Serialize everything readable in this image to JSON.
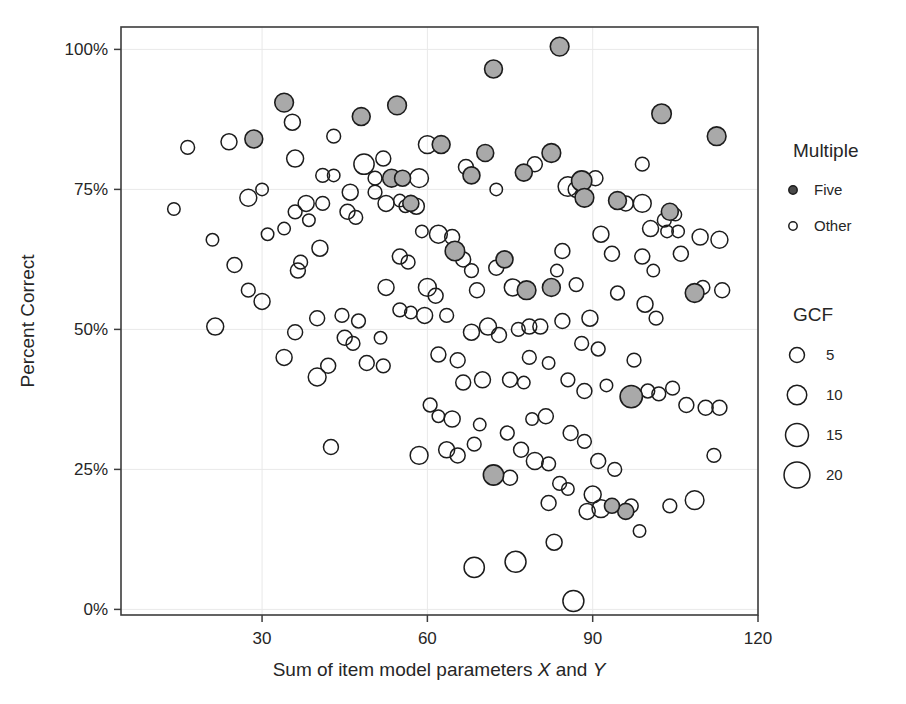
{
  "chart_data": {
    "type": "scatter",
    "title": "",
    "xlabel": "Sum of item model parameters X and Y",
    "xlabel_parts": {
      "lead": "Sum of item model parameters ",
      "em1": "X",
      "mid": " and ",
      "em2": "Y"
    },
    "ylabel": "Percent Correct",
    "xlim": [
      4.4,
      120
    ],
    "ylim": [
      -1,
      104
    ],
    "xticks": [
      30,
      60,
      90,
      120
    ],
    "xticklabels": [
      "30",
      "60",
      "90",
      "120"
    ],
    "yticks": [
      0,
      25,
      50,
      75,
      100
    ],
    "yticklabels": [
      "0%",
      "25%",
      "50%",
      "75%",
      "100%"
    ],
    "grid": true,
    "legend_position": "right",
    "size_encoding": "GCF",
    "color_encoding": "Multiple",
    "series": [
      {
        "name": "Five",
        "marker": "filled-circle",
        "color": "#a9a9a9",
        "points": [
          {
            "x": 84.0,
            "y": 100.5,
            "gcf": 9
          },
          {
            "x": 72.0,
            "y": 96.5,
            "gcf": 8
          },
          {
            "x": 34.0,
            "y": 90.5,
            "gcf": 9
          },
          {
            "x": 54.5,
            "y": 90.0,
            "gcf": 9
          },
          {
            "x": 102.5,
            "y": 88.5,
            "gcf": 10
          },
          {
            "x": 48.0,
            "y": 88.0,
            "gcf": 8
          },
          {
            "x": 112.5,
            "y": 84.5,
            "gcf": 9
          },
          {
            "x": 28.5,
            "y": 84.0,
            "gcf": 8
          },
          {
            "x": 62.5,
            "y": 83.0,
            "gcf": 8
          },
          {
            "x": 70.5,
            "y": 81.5,
            "gcf": 7
          },
          {
            "x": 82.5,
            "y": 81.5,
            "gcf": 9
          },
          {
            "x": 68.0,
            "y": 77.5,
            "gcf": 7
          },
          {
            "x": 77.5,
            "y": 78.0,
            "gcf": 7
          },
          {
            "x": 88.0,
            "y": 76.5,
            "gcf": 11
          },
          {
            "x": 53.5,
            "y": 77.0,
            "gcf": 8
          },
          {
            "x": 55.5,
            "y": 77.0,
            "gcf": 6
          },
          {
            "x": 88.5,
            "y": 73.5,
            "gcf": 9
          },
          {
            "x": 94.5,
            "y": 73.0,
            "gcf": 8
          },
          {
            "x": 57.0,
            "y": 72.5,
            "gcf": 6
          },
          {
            "x": 104.0,
            "y": 71.0,
            "gcf": 7
          },
          {
            "x": 65.0,
            "y": 64.0,
            "gcf": 10
          },
          {
            "x": 74.0,
            "y": 62.5,
            "gcf": 7
          },
          {
            "x": 78.0,
            "y": 57.0,
            "gcf": 9
          },
          {
            "x": 82.5,
            "y": 57.5,
            "gcf": 8
          },
          {
            "x": 108.5,
            "y": 56.5,
            "gcf": 9
          },
          {
            "x": 97.0,
            "y": 38.0,
            "gcf": 14
          },
          {
            "x": 72.0,
            "y": 24.0,
            "gcf": 11
          },
          {
            "x": 96.0,
            "y": 17.5,
            "gcf": 6
          },
          {
            "x": 93.5,
            "y": 18.5,
            "gcf": 5
          }
        ]
      },
      {
        "name": "Other",
        "marker": "open-circle",
        "color": "#ffffff",
        "points": [
          {
            "x": 35.5,
            "y": 87.0,
            "gcf": 6
          },
          {
            "x": 43.0,
            "y": 84.5,
            "gcf": 4
          },
          {
            "x": 24.0,
            "y": 83.5,
            "gcf": 6
          },
          {
            "x": 16.5,
            "y": 82.5,
            "gcf": 4
          },
          {
            "x": 60.0,
            "y": 83.0,
            "gcf": 8
          },
          {
            "x": 52.0,
            "y": 80.5,
            "gcf": 5
          },
          {
            "x": 36.0,
            "y": 80.5,
            "gcf": 7
          },
          {
            "x": 79.5,
            "y": 79.5,
            "gcf": 5
          },
          {
            "x": 48.5,
            "y": 79.5,
            "gcf": 11
          },
          {
            "x": 67.0,
            "y": 79.0,
            "gcf": 5
          },
          {
            "x": 50.5,
            "y": 77.0,
            "gcf": 4
          },
          {
            "x": 41.0,
            "y": 77.5,
            "gcf": 4
          },
          {
            "x": 43.0,
            "y": 77.5,
            "gcf": 3
          },
          {
            "x": 58.5,
            "y": 77.0,
            "gcf": 9
          },
          {
            "x": 99.0,
            "y": 79.5,
            "gcf": 4
          },
          {
            "x": 90.5,
            "y": 77.0,
            "gcf": 5
          },
          {
            "x": 72.5,
            "y": 75.0,
            "gcf": 3
          },
          {
            "x": 85.5,
            "y": 75.5,
            "gcf": 10
          },
          {
            "x": 87.0,
            "y": 75.0,
            "gcf": 6
          },
          {
            "x": 46.0,
            "y": 74.5,
            "gcf": 6
          },
          {
            "x": 50.5,
            "y": 74.5,
            "gcf": 4
          },
          {
            "x": 27.5,
            "y": 73.5,
            "gcf": 7
          },
          {
            "x": 55.0,
            "y": 73.0,
            "gcf": 3
          },
          {
            "x": 30.0,
            "y": 75.0,
            "gcf": 3
          },
          {
            "x": 96.0,
            "y": 72.5,
            "gcf": 5
          },
          {
            "x": 99.0,
            "y": 72.5,
            "gcf": 8
          },
          {
            "x": 38.0,
            "y": 72.5,
            "gcf": 6
          },
          {
            "x": 41.0,
            "y": 72.5,
            "gcf": 4
          },
          {
            "x": 52.5,
            "y": 72.5,
            "gcf": 6
          },
          {
            "x": 56.0,
            "y": 72.0,
            "gcf": 3
          },
          {
            "x": 58.0,
            "y": 72.0,
            "gcf": 6
          },
          {
            "x": 14.0,
            "y": 71.5,
            "gcf": 3
          },
          {
            "x": 36.0,
            "y": 71.0,
            "gcf": 4
          },
          {
            "x": 45.5,
            "y": 71.0,
            "gcf": 5
          },
          {
            "x": 47.0,
            "y": 70.0,
            "gcf": 4
          },
          {
            "x": 38.5,
            "y": 69.5,
            "gcf": 3
          },
          {
            "x": 103.0,
            "y": 69.5,
            "gcf": 4
          },
          {
            "x": 105.0,
            "y": 70.5,
            "gcf": 3
          },
          {
            "x": 100.5,
            "y": 68.0,
            "gcf": 6
          },
          {
            "x": 103.5,
            "y": 67.5,
            "gcf": 3
          },
          {
            "x": 105.5,
            "y": 67.5,
            "gcf": 3
          },
          {
            "x": 34.0,
            "y": 68.0,
            "gcf": 3
          },
          {
            "x": 31.0,
            "y": 67.0,
            "gcf": 3
          },
          {
            "x": 21.0,
            "y": 66.0,
            "gcf": 3
          },
          {
            "x": 59.0,
            "y": 67.5,
            "gcf": 3
          },
          {
            "x": 62.0,
            "y": 67.0,
            "gcf": 8
          },
          {
            "x": 64.5,
            "y": 66.5,
            "gcf": 5
          },
          {
            "x": 91.5,
            "y": 67.0,
            "gcf": 6
          },
          {
            "x": 109.5,
            "y": 66.5,
            "gcf": 6
          },
          {
            "x": 113.0,
            "y": 66.0,
            "gcf": 7
          },
          {
            "x": 40.5,
            "y": 64.5,
            "gcf": 6
          },
          {
            "x": 37.0,
            "y": 62.0,
            "gcf": 4
          },
          {
            "x": 55.0,
            "y": 63.0,
            "gcf": 5
          },
          {
            "x": 56.5,
            "y": 62.0,
            "gcf": 4
          },
          {
            "x": 66.5,
            "y": 62.5,
            "gcf": 5
          },
          {
            "x": 93.5,
            "y": 63.5,
            "gcf": 5
          },
          {
            "x": 99.0,
            "y": 63.0,
            "gcf": 5
          },
          {
            "x": 106.0,
            "y": 63.5,
            "gcf": 5
          },
          {
            "x": 25.0,
            "y": 61.5,
            "gcf": 5
          },
          {
            "x": 36.5,
            "y": 60.5,
            "gcf": 5
          },
          {
            "x": 68.0,
            "y": 60.5,
            "gcf": 4
          },
          {
            "x": 72.5,
            "y": 61.0,
            "gcf": 5
          },
          {
            "x": 83.5,
            "y": 60.5,
            "gcf": 3
          },
          {
            "x": 101.0,
            "y": 60.5,
            "gcf": 3
          },
          {
            "x": 84.5,
            "y": 64.0,
            "gcf": 5
          },
          {
            "x": 27.5,
            "y": 57.0,
            "gcf": 4
          },
          {
            "x": 52.5,
            "y": 57.5,
            "gcf": 6
          },
          {
            "x": 60.0,
            "y": 57.5,
            "gcf": 8
          },
          {
            "x": 61.5,
            "y": 56.0,
            "gcf": 5
          },
          {
            "x": 69.0,
            "y": 57.0,
            "gcf": 5
          },
          {
            "x": 75.5,
            "y": 57.5,
            "gcf": 7
          },
          {
            "x": 87.0,
            "y": 58.0,
            "gcf": 4
          },
          {
            "x": 94.5,
            "y": 56.5,
            "gcf": 4
          },
          {
            "x": 110.0,
            "y": 57.5,
            "gcf": 4
          },
          {
            "x": 113.5,
            "y": 57.0,
            "gcf": 5
          },
          {
            "x": 21.5,
            "y": 50.5,
            "gcf": 7
          },
          {
            "x": 30.0,
            "y": 55.0,
            "gcf": 6
          },
          {
            "x": 40.0,
            "y": 52.0,
            "gcf": 5
          },
          {
            "x": 44.5,
            "y": 52.5,
            "gcf": 4
          },
          {
            "x": 47.5,
            "y": 51.5,
            "gcf": 4
          },
          {
            "x": 55.0,
            "y": 53.5,
            "gcf": 4
          },
          {
            "x": 57.0,
            "y": 53.0,
            "gcf": 3
          },
          {
            "x": 59.5,
            "y": 52.5,
            "gcf": 6
          },
          {
            "x": 63.5,
            "y": 52.5,
            "gcf": 4
          },
          {
            "x": 71.0,
            "y": 50.5,
            "gcf": 7
          },
          {
            "x": 78.5,
            "y": 50.5,
            "gcf": 5
          },
          {
            "x": 80.5,
            "y": 50.5,
            "gcf": 5
          },
          {
            "x": 84.5,
            "y": 51.5,
            "gcf": 5
          },
          {
            "x": 89.5,
            "y": 52.0,
            "gcf": 6
          },
          {
            "x": 99.5,
            "y": 54.5,
            "gcf": 6
          },
          {
            "x": 101.5,
            "y": 52.0,
            "gcf": 4
          },
          {
            "x": 36.0,
            "y": 49.5,
            "gcf": 5
          },
          {
            "x": 45.0,
            "y": 48.5,
            "gcf": 5
          },
          {
            "x": 46.5,
            "y": 47.5,
            "gcf": 4
          },
          {
            "x": 51.5,
            "y": 48.5,
            "gcf": 3
          },
          {
            "x": 68.0,
            "y": 49.5,
            "gcf": 6
          },
          {
            "x": 73.0,
            "y": 49.0,
            "gcf": 5
          },
          {
            "x": 76.5,
            "y": 50.0,
            "gcf": 4
          },
          {
            "x": 88.0,
            "y": 47.5,
            "gcf": 4
          },
          {
            "x": 91.0,
            "y": 46.5,
            "gcf": 4
          },
          {
            "x": 34.0,
            "y": 45.0,
            "gcf": 6
          },
          {
            "x": 42.0,
            "y": 43.5,
            "gcf": 5
          },
          {
            "x": 49.0,
            "y": 44.0,
            "gcf": 5
          },
          {
            "x": 52.0,
            "y": 43.5,
            "gcf": 4
          },
          {
            "x": 62.0,
            "y": 45.5,
            "gcf": 5
          },
          {
            "x": 65.5,
            "y": 44.5,
            "gcf": 5
          },
          {
            "x": 78.5,
            "y": 45.0,
            "gcf": 4
          },
          {
            "x": 82.0,
            "y": 44.0,
            "gcf": 3
          },
          {
            "x": 97.5,
            "y": 44.5,
            "gcf": 4
          },
          {
            "x": 104.5,
            "y": 39.5,
            "gcf": 4
          },
          {
            "x": 40.0,
            "y": 41.5,
            "gcf": 8
          },
          {
            "x": 66.5,
            "y": 40.5,
            "gcf": 5
          },
          {
            "x": 70.0,
            "y": 41.0,
            "gcf": 6
          },
          {
            "x": 75.0,
            "y": 41.0,
            "gcf": 5
          },
          {
            "x": 77.5,
            "y": 40.5,
            "gcf": 3
          },
          {
            "x": 85.5,
            "y": 41.0,
            "gcf": 4
          },
          {
            "x": 88.5,
            "y": 39.0,
            "gcf": 5
          },
          {
            "x": 92.5,
            "y": 40.0,
            "gcf": 3
          },
          {
            "x": 100.0,
            "y": 39.0,
            "gcf": 4
          },
          {
            "x": 102.0,
            "y": 38.5,
            "gcf": 4
          },
          {
            "x": 107.0,
            "y": 36.5,
            "gcf": 5
          },
          {
            "x": 110.5,
            "y": 36.0,
            "gcf": 5
          },
          {
            "x": 113.0,
            "y": 36.0,
            "gcf": 5
          },
          {
            "x": 60.5,
            "y": 36.5,
            "gcf": 4
          },
          {
            "x": 62.0,
            "y": 34.5,
            "gcf": 3
          },
          {
            "x": 64.5,
            "y": 34.0,
            "gcf": 6
          },
          {
            "x": 69.5,
            "y": 33.0,
            "gcf": 3
          },
          {
            "x": 79.0,
            "y": 34.0,
            "gcf": 3
          },
          {
            "x": 81.5,
            "y": 34.5,
            "gcf": 5
          },
          {
            "x": 74.5,
            "y": 31.5,
            "gcf": 4
          },
          {
            "x": 86.0,
            "y": 31.5,
            "gcf": 5
          },
          {
            "x": 88.5,
            "y": 30.0,
            "gcf": 4
          },
          {
            "x": 42.5,
            "y": 29.0,
            "gcf": 5
          },
          {
            "x": 58.5,
            "y": 27.5,
            "gcf": 8
          },
          {
            "x": 63.5,
            "y": 28.5,
            "gcf": 6
          },
          {
            "x": 65.5,
            "y": 27.5,
            "gcf": 5
          },
          {
            "x": 68.5,
            "y": 29.5,
            "gcf": 4
          },
          {
            "x": 77.0,
            "y": 28.5,
            "gcf": 5
          },
          {
            "x": 79.5,
            "y": 26.5,
            "gcf": 7
          },
          {
            "x": 82.0,
            "y": 26.0,
            "gcf": 4
          },
          {
            "x": 91.0,
            "y": 26.5,
            "gcf": 5
          },
          {
            "x": 94.0,
            "y": 25.0,
            "gcf": 4
          },
          {
            "x": 112.0,
            "y": 27.5,
            "gcf": 4
          },
          {
            "x": 75.0,
            "y": 23.5,
            "gcf": 5
          },
          {
            "x": 84.0,
            "y": 22.5,
            "gcf": 4
          },
          {
            "x": 85.5,
            "y": 21.5,
            "gcf": 3
          },
          {
            "x": 90.0,
            "y": 20.5,
            "gcf": 7
          },
          {
            "x": 82.0,
            "y": 19.0,
            "gcf": 5
          },
          {
            "x": 89.0,
            "y": 17.5,
            "gcf": 6
          },
          {
            "x": 91.5,
            "y": 18.0,
            "gcf": 8
          },
          {
            "x": 97.0,
            "y": 18.5,
            "gcf": 4
          },
          {
            "x": 104.0,
            "y": 18.5,
            "gcf": 4
          },
          {
            "x": 108.5,
            "y": 19.5,
            "gcf": 9
          },
          {
            "x": 98.5,
            "y": 14.0,
            "gcf": 3
          },
          {
            "x": 83.0,
            "y": 12.0,
            "gcf": 6
          },
          {
            "x": 68.5,
            "y": 7.5,
            "gcf": 11
          },
          {
            "x": 76.0,
            "y": 8.5,
            "gcf": 12
          },
          {
            "x": 86.5,
            "y": 1.5,
            "gcf": 12
          }
        ]
      }
    ],
    "legends": [
      {
        "title": "Multiple",
        "entries": [
          {
            "label": "Five",
            "marker": "filled-circle"
          },
          {
            "label": "Other",
            "marker": "open-circle"
          }
        ]
      },
      {
        "title": "GCF",
        "entries": [
          {
            "label": "5",
            "value": 5
          },
          {
            "label": "10",
            "value": 10
          },
          {
            "label": "15",
            "value": 15
          },
          {
            "label": "20",
            "value": 20
          }
        ]
      }
    ]
  },
  "colors": {
    "frame": "#3c3c3c",
    "grid": "#e9e9e9",
    "text": "#262626",
    "five_fill": "#a9a9a9",
    "other_fill": "#ffffff",
    "marker_stroke": "#1c1c1c"
  }
}
